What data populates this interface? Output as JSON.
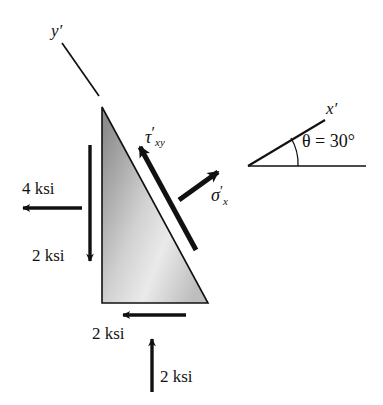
{
  "figure": {
    "background_color": "#ffffff",
    "stroke_color": "#111111"
  },
  "axes": {
    "y_prime": {
      "label": "y′",
      "name": "y-prime-axis"
    },
    "x_prime": {
      "label": "x′",
      "name": "x-prime-axis"
    }
  },
  "angle": {
    "label": "θ = 30°",
    "symbol": "θ",
    "equals": "=",
    "value": "30°",
    "degrees": 30
  },
  "stress_symbols": {
    "shear": {
      "base": "τ",
      "prime": "′",
      "sub": "xy",
      "full": "τ′xy"
    },
    "normal": {
      "base": "σ",
      "prime": "′",
      "sub": "x",
      "full": "σ′x"
    }
  },
  "loads": [
    {
      "name": "left-normal-load",
      "label": "4 ksi",
      "value": 4,
      "unit": "ksi",
      "direction": "left"
    },
    {
      "name": "left-shear-load",
      "label": "2 ksi",
      "value": 2,
      "unit": "ksi",
      "direction": "down"
    },
    {
      "name": "bottom-shear-load",
      "label": "2 ksi",
      "value": 2,
      "unit": "ksi",
      "direction": "left"
    },
    {
      "name": "bottom-normal-load",
      "label": "2 ksi",
      "value": 2,
      "unit": "ksi",
      "direction": "up"
    }
  ],
  "element": {
    "name": "triangular-stress-element",
    "shape": "right-triangle",
    "fill": "gradient-gray",
    "fill_light": "#f3f3f3",
    "fill_dark": "#8d8d8d"
  }
}
